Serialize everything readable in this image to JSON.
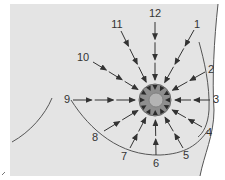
{
  "diagram": {
    "colors": {
      "background": "#ffffff",
      "skin_region": "#e4e4e4",
      "outline": "#555555",
      "arrow": "#333333",
      "areola": "#8e8e8e",
      "areola_edge": "#6a6a6a",
      "nipple": "#b4b4b4"
    },
    "center": {
      "x": 155,
      "y": 100
    },
    "areola_radius": 16,
    "nipple_radius": 7,
    "clock_positions": [
      {
        "label": "12",
        "label_x": 155,
        "label_y": 17,
        "start_x": 155,
        "start_y": 22
      },
      {
        "label": "1",
        "label_x": 197,
        "label_y": 28,
        "start_x": 194,
        "start_y": 30
      },
      {
        "label": "2",
        "label_x": 211,
        "label_y": 73,
        "start_x": 205,
        "start_y": 72
      },
      {
        "label": "3",
        "label_x": 216,
        "label_y": 103,
        "start_x": 210,
        "start_y": 100
      },
      {
        "label": "4",
        "label_x": 209,
        "label_y": 136,
        "start_x": 202,
        "start_y": 127
      },
      {
        "label": "5",
        "label_x": 186,
        "label_y": 159,
        "start_x": 183,
        "start_y": 148
      },
      {
        "label": "6",
        "label_x": 156,
        "label_y": 167,
        "start_x": 156,
        "start_y": 155
      },
      {
        "label": "7",
        "label_x": 124,
        "label_y": 160,
        "start_x": 130,
        "start_y": 148
      },
      {
        "label": "8",
        "label_x": 95,
        "label_y": 141,
        "start_x": 104,
        "start_y": 131
      },
      {
        "label": "9",
        "label_x": 67,
        "label_y": 103,
        "start_x": 73,
        "start_y": 100
      },
      {
        "label": "10",
        "label_x": 83,
        "label_y": 61,
        "start_x": 93,
        "start_y": 62
      },
      {
        "label": "11",
        "label_x": 117,
        "label_y": 28,
        "start_x": 121,
        "start_y": 31
      }
    ]
  }
}
